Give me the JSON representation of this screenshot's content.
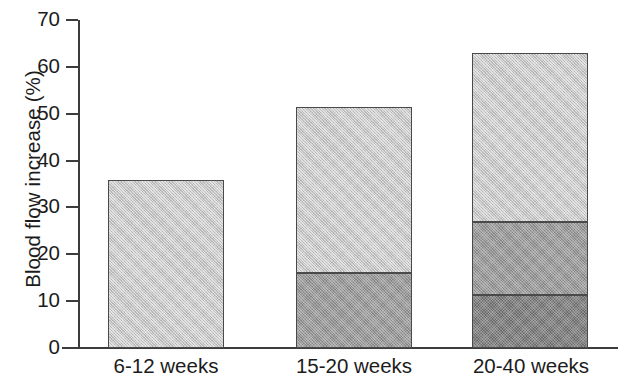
{
  "chart_data": {
    "type": "bar",
    "title": "",
    "subtitle": "",
    "xlabel": "",
    "ylabel": "Blood flow increase (%)",
    "categories": [
      "6-12 weeks",
      "15-20 weeks",
      "20-40 weeks"
    ],
    "ylim": [
      0,
      70
    ],
    "ytick_labels": [
      "70",
      "60",
      "50",
      "40",
      "30",
      "20",
      "10",
      "0"
    ],
    "ytick_values": [
      70,
      60,
      50,
      40,
      30,
      20,
      10,
      0
    ],
    "grid": false,
    "legend": "none",
    "stacked": true,
    "series": [
      {
        "name": "bottom-segment",
        "shade": "dark",
        "color": "#878787",
        "values": [
          0,
          0,
          11.3
        ]
      },
      {
        "name": "middle-segment",
        "shade": "medium",
        "color": "#9b9b9b",
        "values": [
          0,
          16.0,
          15.6
        ]
      },
      {
        "name": "top-segment",
        "shade": "light",
        "color": "#c6c6c6",
        "values": [
          35.8,
          35.4,
          36.1
        ]
      }
    ],
    "cumulative_tops": [
      [
        35.8
      ],
      [
        16.0,
        51.4
      ],
      [
        11.3,
        26.9,
        63.0
      ]
    ],
    "bar_totals": [
      35.8,
      51.4,
      63.0
    ],
    "axis_color": "#3c3c3c",
    "segment_border_color": "#4a4a4a"
  }
}
